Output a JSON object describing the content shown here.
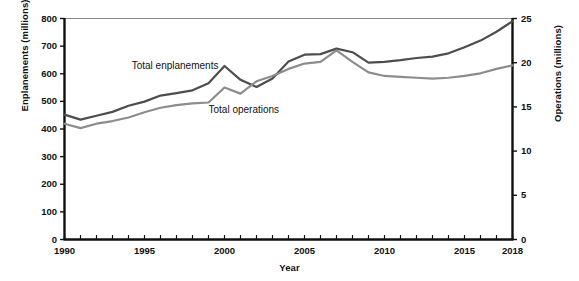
{
  "chart_data": {
    "type": "line",
    "title": "",
    "xlabel": "Year",
    "ylabel": "Enplanements (millions)",
    "y2label": "Operations (millions)",
    "xlim": [
      1990,
      2018
    ],
    "ylim": [
      0,
      800
    ],
    "y2lim": [
      0,
      25
    ],
    "grid": false,
    "legend_position": "inline-annotations",
    "xticks": [
      1990,
      1995,
      2000,
      2005,
      2010,
      2015,
      2018
    ],
    "xtick_labels": [
      "1990",
      "1995",
      "2000",
      "2005",
      "2010",
      "2015",
      "2018"
    ],
    "yticks": [
      0,
      100,
      200,
      300,
      400,
      500,
      600,
      700,
      800
    ],
    "ytick_labels": [
      "0",
      "100",
      "200",
      "300",
      "400",
      "500",
      "600",
      "700",
      "800"
    ],
    "y2ticks": [
      0,
      5,
      10,
      15,
      20,
      25
    ],
    "y2tick_labels": [
      "0",
      "5",
      "10",
      "15",
      "20",
      "25"
    ],
    "x": [
      1990,
      1991,
      1992,
      1993,
      1994,
      1995,
      1996,
      1997,
      1998,
      1999,
      2000,
      2001,
      2002,
      2003,
      2004,
      2005,
      2006,
      2007,
      2008,
      2009,
      2010,
      2011,
      2012,
      2013,
      2014,
      2015,
      2016,
      2017,
      2018
    ],
    "series": [
      {
        "name": "Total enplanements",
        "axis": "left",
        "units": "millions",
        "color": "#4d4d4d",
        "values": [
          452,
          434,
          448,
          462,
          484,
          499,
          521,
          530,
          540,
          566,
          628,
          578,
          552,
          583,
          644,
          669,
          671,
          691,
          678,
          640,
          643,
          649,
          657,
          662,
          674,
          696,
          720,
          752,
          790
        ]
      },
      {
        "name": "Total operations",
        "axis": "right",
        "units": "millions",
        "color": "#8c8c8c",
        "values": [
          13.1,
          12.6,
          13.1,
          13.4,
          13.8,
          14.4,
          14.9,
          15.2,
          15.4,
          15.5,
          17.2,
          16.5,
          17.9,
          18.5,
          19.3,
          19.9,
          20.1,
          21.4,
          20.1,
          18.9,
          18.5,
          18.4,
          18.3,
          18.2,
          18.3,
          18.5,
          18.8,
          19.3,
          19.7
        ]
      }
    ],
    "annotations": [
      {
        "text": "Total enplanements",
        "x": 1994.2,
        "y": 625
      },
      {
        "text": "Total operations",
        "x": 1999.0,
        "y": 465
      }
    ]
  }
}
